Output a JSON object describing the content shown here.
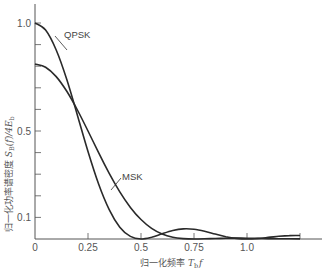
{
  "chart_data": {
    "type": "line",
    "title": "",
    "xlabel": "归一化频率 T_b f",
    "ylabel": "归一化功率谱密度 S_B(f)/4E_b",
    "xlim": [
      0,
      1.35
    ],
    "ylim": [
      0,
      1.0
    ],
    "grid": false,
    "legend": "inline labels",
    "x_ticks": [
      {
        "value": 0,
        "label": "0"
      },
      {
        "value": 0.25,
        "label": "0.25"
      },
      {
        "value": 0.5,
        "label": "0.5"
      },
      {
        "value": 0.75,
        "label": "0.75"
      },
      {
        "value": 1.0,
        "label": "1.0"
      },
      {
        "value": 1.25,
        "label": ""
      }
    ],
    "y_ticks": [
      {
        "value": 0.1,
        "label": "0.1"
      },
      {
        "value": 0.2,
        "label": ""
      },
      {
        "value": 0.3,
        "label": ""
      },
      {
        "value": 0.4,
        "label": ""
      },
      {
        "value": 0.5,
        "label": "0.5"
      },
      {
        "value": 0.6,
        "label": ""
      },
      {
        "value": 0.7,
        "label": ""
      },
      {
        "value": 0.8,
        "label": ""
      },
      {
        "value": 0.9,
        "label": ""
      },
      {
        "value": 1.0,
        "label": "1.0"
      }
    ],
    "x": [
      0,
      0.05,
      0.1,
      0.15,
      0.2,
      0.25,
      0.3,
      0.35,
      0.4,
      0.45,
      0.5,
      0.55,
      0.6,
      0.65,
      0.7,
      0.75,
      0.8,
      0.85,
      0.9,
      0.95,
      1.0,
      1.05,
      1.1,
      1.15,
      1.2,
      1.25
    ],
    "series": [
      {
        "name": "QPSK",
        "values": [
          1.0,
          0.9675,
          0.8751,
          0.7379,
          0.5731,
          0.4053,
          0.2546,
          0.1361,
          0.0547,
          0.0119,
          0.0,
          0.008,
          0.0243,
          0.0392,
          0.0468,
          0.045,
          0.0358,
          0.0229,
          0.0108,
          0.0027,
          0.0,
          0.0022,
          0.0072,
          0.0125,
          0.0159,
          0.0162
        ]
      },
      {
        "name": "MSK",
        "values": [
          0.8106,
          0.7956,
          0.7519,
          0.6837,
          0.5973,
          0.5,
          0.3998,
          0.3039,
          0.218,
          0.1461,
          0.0901,
          0.0497,
          0.0234,
          0.0084,
          0.0017,
          0.0,
          0.0009,
          0.0025,
          0.0037,
          0.0041,
          0.0036,
          0.0028,
          0.002,
          0.0013,
          0.0008,
          0.0004
        ]
      }
    ],
    "annotations": [
      {
        "text": "QPSK",
        "target_series": "QPSK"
      },
      {
        "text": "MSK",
        "target_series": "MSK"
      }
    ]
  },
  "labels": {
    "qpsk": "QPSK",
    "msk": "MSK",
    "xlabel_main": "归一化频率 ",
    "xlabel_T": "T",
    "xlabel_sub": "b",
    "xlabel_f": "f",
    "ylabel_main": "归一化功率谱密度 ",
    "ylabel_S": "S",
    "ylabel_sub": "B",
    "ylabel_rest": "(f)/4E",
    "ylabel_sub2": "b"
  },
  "colors": {
    "curve": "#2a2a2a",
    "axis": "#555555",
    "text": "#555555"
  }
}
